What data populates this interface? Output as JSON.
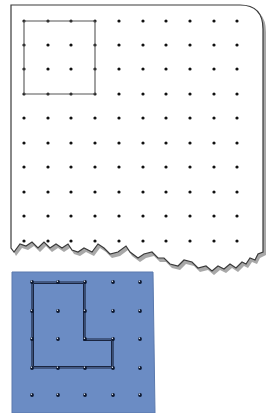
{
  "dot_paper": {
    "background": "#ffffff",
    "border_color": "#3a3a3a",
    "shadow_color": "#9a9a9a",
    "dot_color": "#111111",
    "columns": 10,
    "rows": 10,
    "col_x": [
      24,
      48,
      71,
      95,
      119,
      143,
      166,
      190,
      214,
      237
    ],
    "row_y": [
      21,
      45,
      69,
      94,
      118,
      143,
      167,
      192,
      216,
      241
    ],
    "square_outline": {
      "description": "3x3-unit square drawn on dot paper",
      "corners": [
        [
          0,
          0
        ],
        [
          3,
          0
        ],
        [
          3,
          3
        ],
        [
          0,
          3
        ]
      ]
    }
  },
  "geoboard": {
    "board_color": "#6b8cc4",
    "board_edge_color": "#5a79ad",
    "peg_color": "#0d1830",
    "band_color": "#1a2540",
    "columns": 5,
    "rows": 5,
    "col_x": [
      32,
      58,
      85,
      113,
      140
    ],
    "row_y": [
      282,
      311,
      339,
      368,
      395
    ],
    "l_shape_band": {
      "description": "L-shaped figure formed by a rubber band",
      "vertices": [
        [
          0,
          0
        ],
        [
          2,
          0
        ],
        [
          2,
          2
        ],
        [
          3,
          2
        ],
        [
          3,
          3
        ],
        [
          0,
          3
        ]
      ]
    }
  }
}
